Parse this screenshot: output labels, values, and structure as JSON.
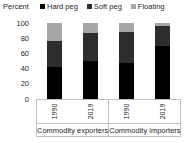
{
  "chart_data": {
    "type": "bar",
    "stacked": true,
    "title": "",
    "ylabel": "Percent",
    "xlabel": "",
    "ylim": [
      0,
      100
    ],
    "yticks": [
      100,
      80,
      60,
      40,
      20,
      0
    ],
    "grid": false,
    "legend_position": "top",
    "groups": [
      "Commodity exporters",
      "Commodity importers"
    ],
    "categories": [
      "1990",
      "2019",
      "1990",
      "2019"
    ],
    "series": [
      {
        "name": "Hard peg",
        "color": "#000000",
        "values": [
          42,
          50,
          47,
          70
        ]
      },
      {
        "name": "Soft peg",
        "color": "#2d2d2d",
        "values": [
          35,
          37,
          41,
          26
        ]
      },
      {
        "name": "Floating",
        "color": "#a6a6a6",
        "values": [
          23,
          13,
          12,
          4
        ]
      }
    ],
    "axis_line_color": "#bfbfbf",
    "text_color": "#262626"
  }
}
